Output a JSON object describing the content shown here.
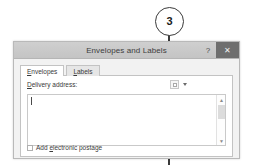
{
  "callout": {
    "number": "3",
    "icon": "callout-pointer-line"
  },
  "dialog": {
    "title": "Envelopes and Labels",
    "window_buttons": {
      "help_glyph": "?",
      "help_name": "help-icon",
      "close_glyph": "✕",
      "close_name": "close-icon"
    },
    "tabs": [
      {
        "label": "Envelopes",
        "accel": "E",
        "active": true
      },
      {
        "label": "Labels",
        "accel": "L",
        "active": false
      }
    ],
    "delivery": {
      "label": "Delivery address:",
      "accel": "D",
      "address_value": "",
      "address_placeholder": "",
      "address_book_button": "address-book-icon",
      "dropdown_arrow": "chevron-down-icon"
    },
    "scrollbar": {
      "up_glyph": "▲",
      "down_glyph": "▼"
    },
    "postage": {
      "label": "Add electronic postage",
      "accel": "e",
      "checked": false
    }
  },
  "colors": {
    "titlebar": "#c8c8c8",
    "close_button": "#6e6e6e",
    "dialog_face": "#f2f2f2",
    "callout_stroke": "#3a3a3a"
  }
}
